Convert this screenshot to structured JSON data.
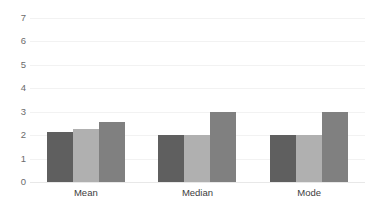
{
  "chart_data": {
    "type": "bar",
    "title": "",
    "subtitle": "",
    "xlabel": "",
    "ylabel": "",
    "categories": [
      "Mean",
      "Median",
      "Mode"
    ],
    "series": [
      {
        "name": "Series 1",
        "color": "#5f5f5f",
        "values": [
          2.15,
          2.0,
          2.0
        ]
      },
      {
        "name": "Series 2",
        "color": "#b0b0b0",
        "values": [
          2.25,
          2.0,
          2.0
        ]
      },
      {
        "name": "Series 3",
        "color": "#808080",
        "values": [
          2.55,
          3.0,
          3.0
        ]
      }
    ],
    "ylim": [
      0,
      7
    ],
    "yticks": [
      0,
      1,
      2,
      3,
      4,
      5,
      6,
      7
    ],
    "ytick_labels": [
      "0",
      "1",
      "2",
      "3",
      "4",
      "5",
      "6",
      "7"
    ],
    "grid": true,
    "grid_axis": "y",
    "grid_color": "#f2f2f2",
    "legend": false,
    "legend_position": "none",
    "annotations": [],
    "background_color": "#ffffff"
  }
}
